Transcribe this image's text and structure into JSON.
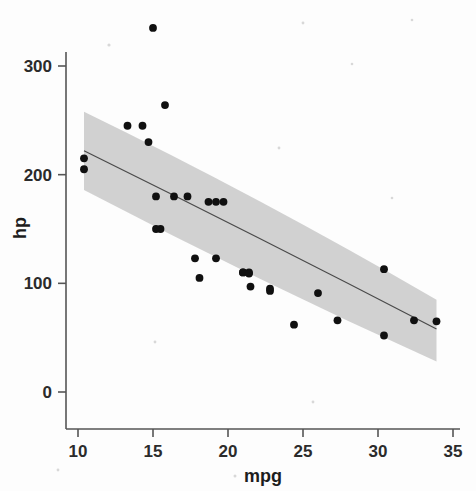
{
  "chart_data": {
    "type": "scatter",
    "title": "",
    "subtitle": "",
    "xlabel": "mpg",
    "ylabel": "hp",
    "xlim": [
      9.0,
      35.6
    ],
    "ylim": [
      -22,
      345
    ],
    "grid": false,
    "legend": null,
    "xticks": [
      10,
      15,
      20,
      25,
      30,
      35
    ],
    "yticks": [
      0,
      100,
      200,
      300
    ],
    "xtick_labels": [
      "10",
      "15",
      "20",
      "25",
      "30",
      "35"
    ],
    "ytick_labels": [
      "0",
      "100",
      "200",
      "300"
    ],
    "marker": "filled-circle",
    "marker_color": "#101010",
    "points": [
      {
        "x": 21.0,
        "y": 110
      },
      {
        "x": 21.0,
        "y": 110
      },
      {
        "x": 22.8,
        "y": 93
      },
      {
        "x": 21.4,
        "y": 110
      },
      {
        "x": 18.7,
        "y": 175
      },
      {
        "x": 18.1,
        "y": 105
      },
      {
        "x": 14.3,
        "y": 245
      },
      {
        "x": 24.4,
        "y": 62
      },
      {
        "x": 22.8,
        "y": 95
      },
      {
        "x": 19.2,
        "y": 123
      },
      {
        "x": 17.8,
        "y": 123
      },
      {
        "x": 16.4,
        "y": 180
      },
      {
        "x": 17.3,
        "y": 180
      },
      {
        "x": 15.2,
        "y": 180
      },
      {
        "x": 10.4,
        "y": 205
      },
      {
        "x": 10.4,
        "y": 215
      },
      {
        "x": 14.7,
        "y": 230
      },
      {
        "x": 32.4,
        "y": 66
      },
      {
        "x": 30.4,
        "y": 52
      },
      {
        "x": 33.9,
        "y": 65
      },
      {
        "x": 21.5,
        "y": 97
      },
      {
        "x": 15.5,
        "y": 150
      },
      {
        "x": 15.2,
        "y": 150
      },
      {
        "x": 13.3,
        "y": 245
      },
      {
        "x": 19.2,
        "y": 175
      },
      {
        "x": 27.3,
        "y": 66
      },
      {
        "x": 26.0,
        "y": 91
      },
      {
        "x": 30.4,
        "y": 113
      },
      {
        "x": 15.8,
        "y": 264
      },
      {
        "x": 19.7,
        "y": 175
      },
      {
        "x": 15.0,
        "y": 335
      },
      {
        "x": 21.4,
        "y": 109
      }
    ],
    "fit": {
      "type": "linear-regression-smooth",
      "line_color": "#4a4a4a",
      "ribbon_color": "#c9c9c9",
      "ribbon_label": "95% confidence band",
      "x_start": 10.4,
      "x_end": 33.9,
      "y_start": 222.0,
      "y_end": 58.0,
      "ci_start_upper": 258.0,
      "ci_start_lower": 186.0,
      "ci_end_upper": 85.0,
      "ci_end_lower": 28.0
    }
  },
  "axes": {
    "x_title": "mpg",
    "y_title": "hp"
  }
}
